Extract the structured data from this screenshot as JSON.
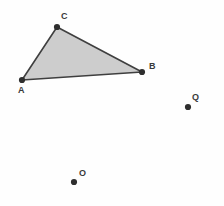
{
  "figure": {
    "width": 224,
    "height": 206,
    "background_color": "#fefefe"
  },
  "style": {
    "polygon_fill": "#cdcdcd",
    "polygon_stroke": "#3f3f3f",
    "polygon_stroke_width": 1.6,
    "point_color": "#2e2e2e",
    "point_radius": 3.1,
    "label_color": "#3a3a3a"
  },
  "chart_data": {
    "type": "scatter",
    "xlabel": "",
    "ylabel": "",
    "xlim": [
      0,
      224
    ],
    "ylim": [
      206,
      0
    ],
    "grid": false,
    "legend": "none",
    "shapes": [
      {
        "name": "triangle-abc",
        "type": "polygon",
        "vertices": [
          "A",
          "C",
          "B"
        ],
        "points": [
          [
            22,
            80
          ],
          [
            57,
            27
          ],
          [
            142,
            72
          ]
        ],
        "fill": "#cdcdcd",
        "stroke": "#3f3f3f"
      }
    ],
    "points": [
      {
        "label": "A",
        "x": 22,
        "y": 80,
        "label_x": 18,
        "label_y": 86,
        "on_shape": "triangle-abc"
      },
      {
        "label": "B",
        "x": 142,
        "y": 72,
        "label_x": 149,
        "label_y": 62,
        "on_shape": "triangle-abc"
      },
      {
        "label": "C",
        "x": 57,
        "y": 27,
        "label_x": 61,
        "label_y": 12,
        "on_shape": "triangle-abc"
      },
      {
        "label": "Q",
        "x": 188,
        "y": 107,
        "label_x": 192,
        "label_y": 93,
        "on_shape": null
      },
      {
        "label": "O",
        "x": 74,
        "y": 182,
        "label_x": 79,
        "label_y": 169,
        "on_shape": null
      }
    ]
  },
  "labels": {
    "a": "A",
    "b": "B",
    "c": "C",
    "q": "Q",
    "o": "O"
  }
}
